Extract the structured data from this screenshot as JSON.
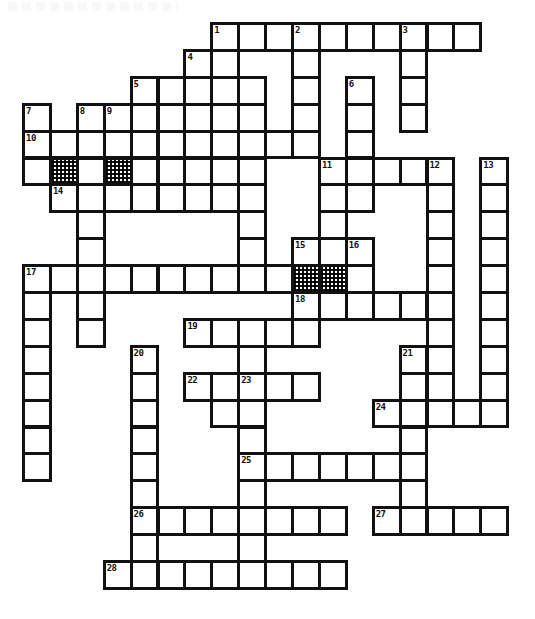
{
  "puzzle": {
    "title": "Crossword Puzzle Grid",
    "cell_size": 26.9,
    "origin_x": 22,
    "origin_y": 22,
    "columns": 18,
    "rows": 22,
    "ink_color": "#111111",
    "paper_color": "#ffffff",
    "blocked_cell_style": "checkerboard-hatch",
    "numbered_clue_count": 28,
    "blocked_cell_count": 4,
    "clue_numbers": [
      1,
      2,
      3,
      4,
      5,
      6,
      7,
      8,
      9,
      10,
      11,
      12,
      13,
      14,
      15,
      16,
      17,
      18,
      19,
      20,
      21,
      22,
      23,
      24,
      25,
      26,
      27,
      28
    ],
    "numbers": [
      {
        "n": 1,
        "col": 7,
        "row": 0
      },
      {
        "n": 2,
        "col": 10,
        "row": 0
      },
      {
        "n": 3,
        "col": 14,
        "row": 0
      },
      {
        "n": 4,
        "col": 6,
        "row": 1
      },
      {
        "n": 5,
        "col": 4,
        "row": 2
      },
      {
        "n": 6,
        "col": 12,
        "row": 2
      },
      {
        "n": 7,
        "col": 0,
        "row": 3
      },
      {
        "n": 8,
        "col": 2,
        "row": 3
      },
      {
        "n": 9,
        "col": 3,
        "row": 3
      },
      {
        "n": 10,
        "col": 0,
        "row": 4
      },
      {
        "n": 11,
        "col": 11,
        "row": 5
      },
      {
        "n": 12,
        "col": 15,
        "row": 5
      },
      {
        "n": 13,
        "col": 17,
        "row": 5
      },
      {
        "n": 14,
        "col": 1,
        "row": 6
      },
      {
        "n": 15,
        "col": 10,
        "row": 8
      },
      {
        "n": 16,
        "col": 12,
        "row": 8
      },
      {
        "n": 17,
        "col": 0,
        "row": 9
      },
      {
        "n": 18,
        "col": 10,
        "row": 10
      },
      {
        "n": 19,
        "col": 6,
        "row": 11
      },
      {
        "n": 20,
        "col": 4,
        "row": 12
      },
      {
        "n": 21,
        "col": 14,
        "row": 12
      },
      {
        "n": 22,
        "col": 6,
        "row": 13
      },
      {
        "n": 23,
        "col": 8,
        "row": 13
      },
      {
        "n": 24,
        "col": 13,
        "row": 14
      },
      {
        "n": 25,
        "col": 8,
        "row": 16
      },
      {
        "n": 26,
        "col": 4,
        "row": 18
      },
      {
        "n": 27,
        "col": 13,
        "row": 18
      },
      {
        "n": 28,
        "col": 3,
        "row": 20
      }
    ],
    "blocked": [
      {
        "col": 1,
        "row": 5
      },
      {
        "col": 3,
        "row": 5
      },
      {
        "col": 10,
        "row": 9
      },
      {
        "col": 11,
        "row": 9
      }
    ],
    "cells": [
      {
        "col": 7,
        "row": 0
      },
      {
        "col": 8,
        "row": 0
      },
      {
        "col": 9,
        "row": 0
      },
      {
        "col": 10,
        "row": 0
      },
      {
        "col": 11,
        "row": 0
      },
      {
        "col": 12,
        "row": 0
      },
      {
        "col": 13,
        "row": 0
      },
      {
        "col": 14,
        "row": 0
      },
      {
        "col": 15,
        "row": 0
      },
      {
        "col": 16,
        "row": 0
      },
      {
        "col": 6,
        "row": 1
      },
      {
        "col": 7,
        "row": 1
      },
      {
        "col": 10,
        "row": 1
      },
      {
        "col": 14,
        "row": 1
      },
      {
        "col": 4,
        "row": 2
      },
      {
        "col": 5,
        "row": 2
      },
      {
        "col": 6,
        "row": 2
      },
      {
        "col": 7,
        "row": 2
      },
      {
        "col": 8,
        "row": 2
      },
      {
        "col": 10,
        "row": 2
      },
      {
        "col": 12,
        "row": 2
      },
      {
        "col": 14,
        "row": 2
      },
      {
        "col": 0,
        "row": 3
      },
      {
        "col": 2,
        "row": 3
      },
      {
        "col": 3,
        "row": 3
      },
      {
        "col": 4,
        "row": 3
      },
      {
        "col": 5,
        "row": 3
      },
      {
        "col": 6,
        "row": 3
      },
      {
        "col": 7,
        "row": 3
      },
      {
        "col": 8,
        "row": 3
      },
      {
        "col": 10,
        "row": 3
      },
      {
        "col": 12,
        "row": 3
      },
      {
        "col": 14,
        "row": 3
      },
      {
        "col": 0,
        "row": 4
      },
      {
        "col": 1,
        "row": 4
      },
      {
        "col": 2,
        "row": 4
      },
      {
        "col": 3,
        "row": 4
      },
      {
        "col": 4,
        "row": 4
      },
      {
        "col": 5,
        "row": 4
      },
      {
        "col": 6,
        "row": 4
      },
      {
        "col": 7,
        "row": 4
      },
      {
        "col": 8,
        "row": 4
      },
      {
        "col": 9,
        "row": 4
      },
      {
        "col": 10,
        "row": 4
      },
      {
        "col": 12,
        "row": 4
      },
      {
        "col": 0,
        "row": 5
      },
      {
        "col": 1,
        "row": 5
      },
      {
        "col": 2,
        "row": 5
      },
      {
        "col": 3,
        "row": 5
      },
      {
        "col": 4,
        "row": 5
      },
      {
        "col": 5,
        "row": 5
      },
      {
        "col": 6,
        "row": 5
      },
      {
        "col": 7,
        "row": 5
      },
      {
        "col": 8,
        "row": 5
      },
      {
        "col": 11,
        "row": 5
      },
      {
        "col": 12,
        "row": 5
      },
      {
        "col": 13,
        "row": 5
      },
      {
        "col": 14,
        "row": 5
      },
      {
        "col": 15,
        "row": 5
      },
      {
        "col": 17,
        "row": 5
      },
      {
        "col": 1,
        "row": 6
      },
      {
        "col": 2,
        "row": 6
      },
      {
        "col": 3,
        "row": 6
      },
      {
        "col": 4,
        "row": 6
      },
      {
        "col": 5,
        "row": 6
      },
      {
        "col": 6,
        "row": 6
      },
      {
        "col": 7,
        "row": 6
      },
      {
        "col": 8,
        "row": 6
      },
      {
        "col": 11,
        "row": 6
      },
      {
        "col": 12,
        "row": 6
      },
      {
        "col": 15,
        "row": 6
      },
      {
        "col": 17,
        "row": 6
      },
      {
        "col": 2,
        "row": 7
      },
      {
        "col": 8,
        "row": 7
      },
      {
        "col": 11,
        "row": 7
      },
      {
        "col": 15,
        "row": 7
      },
      {
        "col": 17,
        "row": 7
      },
      {
        "col": 2,
        "row": 8
      },
      {
        "col": 8,
        "row": 8
      },
      {
        "col": 10,
        "row": 8
      },
      {
        "col": 11,
        "row": 8
      },
      {
        "col": 12,
        "row": 8
      },
      {
        "col": 15,
        "row": 8
      },
      {
        "col": 17,
        "row": 8
      },
      {
        "col": 0,
        "row": 9
      },
      {
        "col": 1,
        "row": 9
      },
      {
        "col": 2,
        "row": 9
      },
      {
        "col": 3,
        "row": 9
      },
      {
        "col": 4,
        "row": 9
      },
      {
        "col": 5,
        "row": 9
      },
      {
        "col": 6,
        "row": 9
      },
      {
        "col": 7,
        "row": 9
      },
      {
        "col": 8,
        "row": 9
      },
      {
        "col": 9,
        "row": 9
      },
      {
        "col": 10,
        "row": 9
      },
      {
        "col": 11,
        "row": 9
      },
      {
        "col": 12,
        "row": 9
      },
      {
        "col": 15,
        "row": 9
      },
      {
        "col": 17,
        "row": 9
      },
      {
        "col": 0,
        "row": 10
      },
      {
        "col": 2,
        "row": 10
      },
      {
        "col": 10,
        "row": 10
      },
      {
        "col": 11,
        "row": 10
      },
      {
        "col": 12,
        "row": 10
      },
      {
        "col": 13,
        "row": 10
      },
      {
        "col": 14,
        "row": 10
      },
      {
        "col": 15,
        "row": 10
      },
      {
        "col": 17,
        "row": 10
      },
      {
        "col": 0,
        "row": 11
      },
      {
        "col": 2,
        "row": 11
      },
      {
        "col": 6,
        "row": 11
      },
      {
        "col": 7,
        "row": 11
      },
      {
        "col": 8,
        "row": 11
      },
      {
        "col": 9,
        "row": 11
      },
      {
        "col": 10,
        "row": 11
      },
      {
        "col": 15,
        "row": 11
      },
      {
        "col": 17,
        "row": 11
      },
      {
        "col": 0,
        "row": 12
      },
      {
        "col": 4,
        "row": 12
      },
      {
        "col": 8,
        "row": 12
      },
      {
        "col": 14,
        "row": 12
      },
      {
        "col": 15,
        "row": 12
      },
      {
        "col": 17,
        "row": 12
      },
      {
        "col": 0,
        "row": 13
      },
      {
        "col": 4,
        "row": 13
      },
      {
        "col": 6,
        "row": 13
      },
      {
        "col": 7,
        "row": 13
      },
      {
        "col": 8,
        "row": 13
      },
      {
        "col": 9,
        "row": 13
      },
      {
        "col": 10,
        "row": 13
      },
      {
        "col": 14,
        "row": 13
      },
      {
        "col": 15,
        "row": 13
      },
      {
        "col": 17,
        "row": 13
      },
      {
        "col": 0,
        "row": 14
      },
      {
        "col": 4,
        "row": 14
      },
      {
        "col": 7,
        "row": 14
      },
      {
        "col": 8,
        "row": 14
      },
      {
        "col": 13,
        "row": 14
      },
      {
        "col": 14,
        "row": 14
      },
      {
        "col": 15,
        "row": 14
      },
      {
        "col": 16,
        "row": 14
      },
      {
        "col": 17,
        "row": 14
      },
      {
        "col": 0,
        "row": 15
      },
      {
        "col": 4,
        "row": 15
      },
      {
        "col": 8,
        "row": 15
      },
      {
        "col": 14,
        "row": 15
      },
      {
        "col": 0,
        "row": 16
      },
      {
        "col": 4,
        "row": 16
      },
      {
        "col": 8,
        "row": 16
      },
      {
        "col": 9,
        "row": 16
      },
      {
        "col": 10,
        "row": 16
      },
      {
        "col": 11,
        "row": 16
      },
      {
        "col": 12,
        "row": 16
      },
      {
        "col": 13,
        "row": 16
      },
      {
        "col": 14,
        "row": 16
      },
      {
        "col": 4,
        "row": 17
      },
      {
        "col": 8,
        "row": 17
      },
      {
        "col": 14,
        "row": 17
      },
      {
        "col": 4,
        "row": 18
      },
      {
        "col": 5,
        "row": 18
      },
      {
        "col": 6,
        "row": 18
      },
      {
        "col": 7,
        "row": 18
      },
      {
        "col": 8,
        "row": 18
      },
      {
        "col": 9,
        "row": 18
      },
      {
        "col": 10,
        "row": 18
      },
      {
        "col": 11,
        "row": 18
      },
      {
        "col": 13,
        "row": 18
      },
      {
        "col": 14,
        "row": 18
      },
      {
        "col": 15,
        "row": 18
      },
      {
        "col": 16,
        "row": 18
      },
      {
        "col": 17,
        "row": 18
      },
      {
        "col": 4,
        "row": 19
      },
      {
        "col": 8,
        "row": 19
      },
      {
        "col": 3,
        "row": 20
      },
      {
        "col": 4,
        "row": 20
      },
      {
        "col": 5,
        "row": 20
      },
      {
        "col": 6,
        "row": 20
      },
      {
        "col": 7,
        "row": 20
      },
      {
        "col": 8,
        "row": 20
      },
      {
        "col": 9,
        "row": 20
      },
      {
        "col": 10,
        "row": 20
      },
      {
        "col": 11,
        "row": 20
      }
    ]
  }
}
